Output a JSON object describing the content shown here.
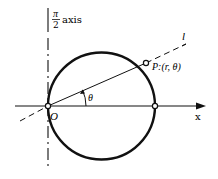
{
  "figure": {
    "colors": {
      "background": "#ffffff",
      "stroke": "#111111"
    }
  },
  "labels": {
    "vertical_axis_numerator": "π",
    "vertical_axis_denominator": "2",
    "vertical_axis_suffix": "axis",
    "line_label": "l",
    "point_label": "P:(r, θ)",
    "origin_label": "O",
    "angle_label": "θ",
    "x_axis_label": "x"
  },
  "geometry": {
    "origin": [
      48,
      106
    ],
    "circle_center": [
      101.5,
      106
    ],
    "circle_radius": 53.5,
    "point_P": [
      146,
      63
    ],
    "right_intersection": [
      155,
      106
    ]
  }
}
